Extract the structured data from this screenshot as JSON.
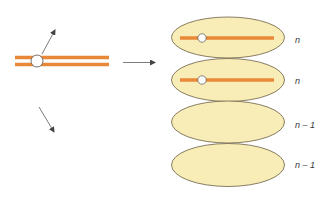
{
  "colors": {
    "chromosome": "#E8893A",
    "cell_fill": "#F8EDB6",
    "cell_stroke": "#6B5E45",
    "arrow": "#444444",
    "centromere_fill": "#FFFFFF",
    "centromere_stroke": "#555555",
    "label": "#333333"
  },
  "diagram": {
    "source": {
      "description": "Paired chromatids joined at centromere",
      "arrows": [
        "up-right",
        "down-right",
        "right"
      ]
    },
    "cells": [
      {
        "label": "n",
        "has_chromosome": true
      },
      {
        "label": "n",
        "has_chromosome": true
      },
      {
        "label": "n – 1",
        "has_chromosome": false
      },
      {
        "label": "n – 1",
        "has_chromosome": false
      }
    ]
  }
}
